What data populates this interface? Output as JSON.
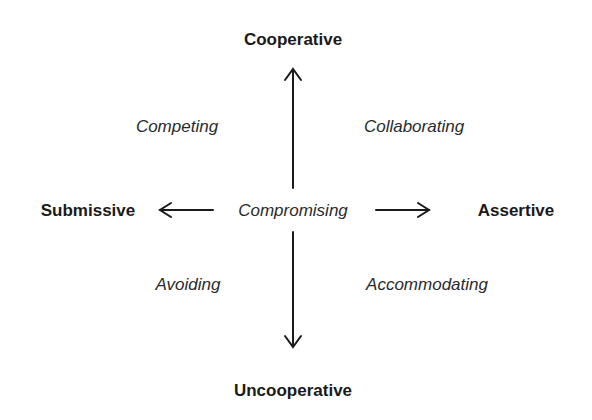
{
  "diagram": {
    "axes": {
      "top": "Cooperative",
      "bottom": "Uncooperative",
      "left": "Submissive",
      "right": "Assertive"
    },
    "modes": {
      "top_left": "Competing",
      "top_right": "Collaborating",
      "center": "Compromising",
      "bottom_left": "Avoiding",
      "bottom_right": "Accommodating"
    },
    "colors": {
      "background": "#ffffff",
      "text": "#1e1e1e",
      "arrow": "#1a1a1a"
    }
  }
}
